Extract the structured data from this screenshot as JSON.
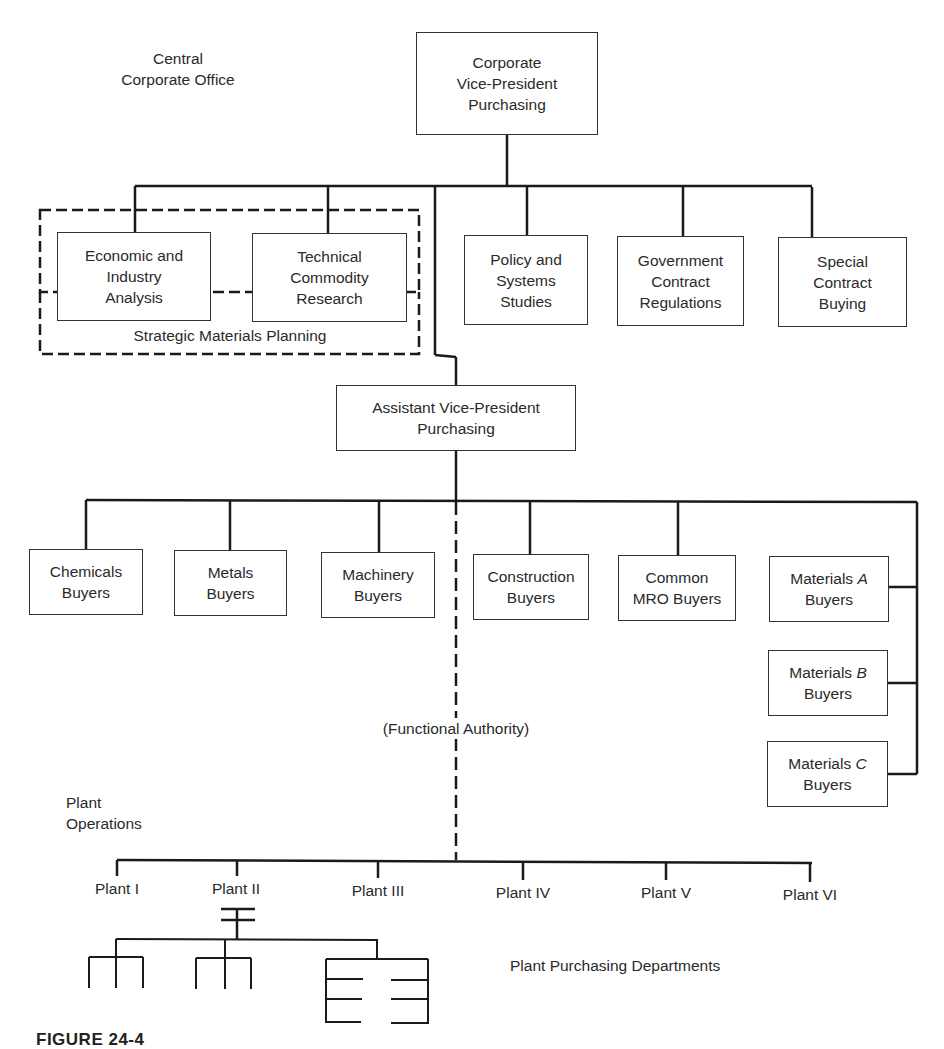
{
  "section_labels": {
    "central_office": [
      "Central",
      "Corporate Office"
    ],
    "plant_operations": [
      "Plant",
      "Operations"
    ],
    "strategic_planning": "Strategic Materials Planning",
    "functional_authority": "(Functional Authority)",
    "plant_purchasing": "Plant Purchasing Departments"
  },
  "top": {
    "vp": [
      "Corporate",
      "Vice-President",
      "Purchasing"
    ]
  },
  "staff": [
    {
      "id": "economic",
      "lines": [
        "Economic and",
        "Industry",
        "Analysis"
      ]
    },
    {
      "id": "technical",
      "lines": [
        "Technical",
        "Commodity",
        "Research"
      ]
    },
    {
      "id": "policy",
      "lines": [
        "Policy and",
        "Systems",
        "Studies"
      ]
    },
    {
      "id": "government",
      "lines": [
        "Government",
        "Contract",
        "Regulations"
      ]
    },
    {
      "id": "special",
      "lines": [
        "Special",
        "Contract",
        "Buying"
      ]
    }
  ],
  "assistant_vp": [
    "Assistant Vice-President",
    "Purchasing"
  ],
  "buyers": [
    {
      "id": "chemicals",
      "lines": [
        "Chemicals",
        "Buyers"
      ]
    },
    {
      "id": "metals",
      "lines": [
        "Metals",
        "Buyers"
      ]
    },
    {
      "id": "machinery",
      "lines": [
        "Machinery",
        "Buyers"
      ]
    },
    {
      "id": "construction",
      "lines": [
        "Construction",
        "Buyers"
      ]
    },
    {
      "id": "common-mro",
      "lines": [
        "Common",
        "MRO Buyers"
      ]
    }
  ],
  "materials": [
    {
      "id": "materials-a",
      "name": "Materials ",
      "letter": "A",
      "sub": "Buyers"
    },
    {
      "id": "materials-b",
      "name": "Materials ",
      "letter": "B",
      "sub": "Buyers"
    },
    {
      "id": "materials-c",
      "name": "Materials ",
      "letter": "C",
      "sub": "Buyers"
    }
  ],
  "plants": [
    "Plant I",
    "Plant II",
    "Plant III",
    "Plant IV",
    "Plant V",
    "Plant VI"
  ],
  "caption": "FIGURE  24-4"
}
